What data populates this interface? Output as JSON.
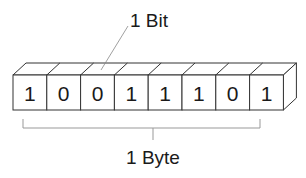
{
  "diagram": {
    "bit_label": "1 Bit",
    "byte_label": "1 Byte",
    "bits": [
      "1",
      "0",
      "0",
      "1",
      "1",
      "1",
      "0",
      "1"
    ],
    "line_color": "#333333",
    "leader_color": "#888888"
  }
}
